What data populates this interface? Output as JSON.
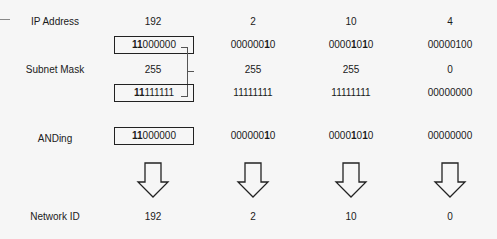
{
  "rows": {
    "ip": {
      "label": "IP Address",
      "values": [
        "192",
        "2",
        "10",
        "4"
      ]
    },
    "ip_binary": [
      {
        "bold": "11",
        "rest": "000000",
        "boxed": true
      },
      {
        "pre": "000000",
        "bold": "1",
        "mid": "0",
        "boxed": false
      },
      {
        "pre": "0000",
        "bold": "1",
        "mid": "0",
        "bold2": "1",
        "post": "0",
        "boxed": false
      },
      {
        "text": "00000100",
        "boxed": false
      }
    ],
    "mask": {
      "label": "Subnet Mask",
      "values": [
        "255",
        "255",
        "255",
        "0"
      ]
    },
    "mask_binary": [
      {
        "bold": "11",
        "rest": "111111",
        "boxed": true
      },
      {
        "text": "11111111",
        "boxed": false
      },
      {
        "text": "11111111",
        "boxed": false
      },
      {
        "text": "00000000",
        "boxed": false
      }
    ],
    "anding": {
      "label": "ANDing",
      "values": [
        "11000000",
        "00000010",
        "00001010",
        "00000000"
      ]
    },
    "network": {
      "label": "Network ID",
      "values": [
        "192",
        "2",
        "10",
        "0"
      ]
    }
  },
  "binary_text": {
    "ip0_bold": "11",
    "ip0_rest": "000000",
    "ip1_a": "000000",
    "ip1_b": "1",
    "ip1_c": "0",
    "ip2_a": "0000",
    "ip2_b": "1",
    "ip2_c": "0",
    "ip2_d": "1",
    "ip2_e": "0",
    "ip3": "00000100",
    "m0_bold": "11",
    "m0_rest": "111111",
    "m1": "11111111",
    "m2": "11111111",
    "m3": "00000000",
    "a0_bold": "11",
    "a0_rest": "000000",
    "a1_a": "000000",
    "a1_b": "1",
    "a1_c": "0",
    "a2_a": "0000",
    "a2_b": "1",
    "a2_c": "0",
    "a2_d": "1",
    "a2_e": "0",
    "a3": "00000000"
  },
  "colors": {
    "background": "#f6f6f6",
    "stroke": "#222222",
    "text": "#1a1a1a"
  }
}
